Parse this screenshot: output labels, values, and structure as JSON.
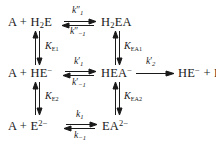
{
  "diagram": {
    "type": "reaction-scheme",
    "stroke_color": "#1a1a1a",
    "background_color": "#ffffff",
    "species": {
      "top_left": {
        "prefix": "A + H",
        "sub1": "2",
        "suffix": "E"
      },
      "top_right": {
        "prefix": "H",
        "sub1": "2",
        "suffix": "EA"
      },
      "mid_left": {
        "text": "A + HE",
        "charge": "−"
      },
      "mid_right": {
        "text": "HEA",
        "charge": "−"
      },
      "mid_product": {
        "text": "HE",
        "charge": "−",
        "tail": " + P"
      },
      "bottom_left": {
        "text": "A + E",
        "charge": "2−"
      },
      "bottom_right": {
        "text": "EA",
        "charge": "2−"
      }
    },
    "rate_constants": {
      "top_forward": {
        "symbol": "k",
        "primes": "″",
        "sub": "1"
      },
      "top_reverse": {
        "symbol": "k",
        "primes": "″",
        "sub": "−1"
      },
      "mid_forward": {
        "symbol": "k",
        "primes": "′",
        "sub": "1"
      },
      "mid_reverse": {
        "symbol": "k",
        "primes": "′",
        "sub": "−1"
      },
      "product_step": {
        "symbol": "k",
        "primes": "′",
        "sub": "2"
      },
      "bottom_forward": {
        "symbol": "k",
        "primes": "",
        "sub": "1"
      },
      "bottom_reverse": {
        "symbol": "k",
        "primes": "",
        "sub": "−1"
      }
    },
    "equilibrium_constants": {
      "left_upper": {
        "symbol": "K",
        "sub": "E1"
      },
      "right_upper": {
        "symbol": "K",
        "sub": "EA1"
      },
      "left_lower": {
        "symbol": "K",
        "sub": "E2"
      },
      "right_lower": {
        "symbol": "K",
        "sub": "EA2"
      }
    }
  }
}
